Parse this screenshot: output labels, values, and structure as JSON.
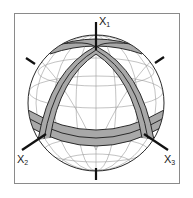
{
  "figure": {
    "axes": [
      {
        "name": "X",
        "subscript": "1"
      },
      {
        "name": "X",
        "subscript": "2"
      },
      {
        "name": "X",
        "subscript": "3"
      }
    ],
    "colors": {
      "band_fill": "#a8a8a8",
      "band_edge": "#2a2a2a",
      "grid": "#9a9a9a",
      "outline": "#2a2a2a",
      "frame": "#8a8a8a",
      "background": "#ffffff"
    }
  }
}
